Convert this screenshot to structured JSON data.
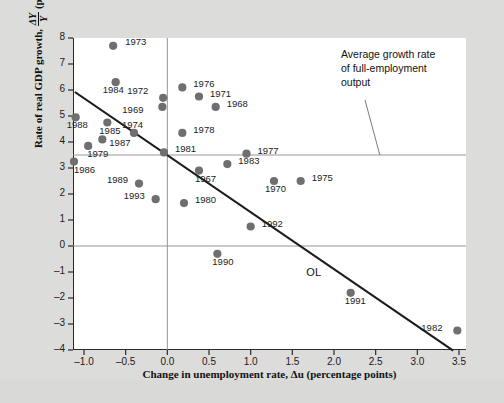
{
  "chart_data": {
    "type": "scatter",
    "title": "",
    "xlabel": "Change in unemployment rate, Δu (percentage points)",
    "ylabel": "Rate of real GDP growth, ΔY/Y (percent per year)",
    "xlim": [
      -1.25,
      3.6
    ],
    "ylim": [
      -4,
      8
    ],
    "xticks": [
      "–1.0",
      "–0.5",
      "0.0",
      "0.5",
      "1.0",
      "1.5",
      "2.0",
      "2.5",
      "3.0",
      "3.5"
    ],
    "xtick_values": [
      -1.0,
      -0.5,
      0.0,
      0.5,
      1.0,
      1.5,
      2.0,
      2.5,
      3.0,
      3.5
    ],
    "yticks": [
      "8",
      "7",
      "6",
      "5",
      "4",
      "3",
      "2",
      "1",
      "0",
      "–1",
      "–2",
      "–3",
      "–4"
    ],
    "ytick_values": [
      8,
      7,
      6,
      5,
      4,
      3,
      2,
      1,
      0,
      -1,
      -2,
      -3,
      -4
    ],
    "grid": false,
    "reference_lines": [
      {
        "name": "full-employment-growth-line",
        "orientation": "horizontal",
        "y": 3.5
      },
      {
        "name": "zero-growth-line",
        "orientation": "horizontal",
        "y": 0
      },
      {
        "name": "zero-unemployment-change-line",
        "orientation": "vertical",
        "x": 0
      }
    ],
    "fit_line": {
      "label": "OL",
      "name": "okuns-law-line",
      "x0": -1.1,
      "y0": 5.9,
      "x1": 3.42,
      "y1": -4.0
    },
    "annotation": {
      "text": "Average growth rate of full-employment output",
      "lines": [
        "Average growth rate",
        "of full-employment",
        "output"
      ],
      "points_to": {
        "x": 2.55,
        "y": 3.5
      }
    },
    "point_color": "#6f6f6f",
    "line_color": "#1b1b1b",
    "points": [
      {
        "label": "1973",
        "x": -0.65,
        "y": 7.7,
        "lx": 12,
        "ly": -5
      },
      {
        "label": "1984",
        "x": -0.62,
        "y": 6.3,
        "lx": -13,
        "ly": 7
      },
      {
        "label": "1972",
        "x": -0.05,
        "y": 5.7,
        "lx": -36,
        "ly": -8
      },
      {
        "label": "1969",
        "x": -0.06,
        "y": 5.35,
        "lx": -40,
        "ly": 2
      },
      {
        "label": "1976",
        "x": 0.18,
        "y": 6.1,
        "lx": 11,
        "ly": -4
      },
      {
        "label": "1971",
        "x": 0.38,
        "y": 5.75,
        "lx": 11,
        "ly": -4
      },
      {
        "label": "1968",
        "x": 0.58,
        "y": 5.35,
        "lx": 11,
        "ly": -4
      },
      {
        "label": "1988",
        "x": -1.1,
        "y": 4.95,
        "lx": -9,
        "ly": 7
      },
      {
        "label": "1985",
        "x": -0.72,
        "y": 4.75,
        "lx": -8,
        "ly": 7
      },
      {
        "label": "1974",
        "x": -0.4,
        "y": 4.35,
        "lx": -12,
        "ly": -9
      },
      {
        "label": "1978",
        "x": 0.18,
        "y": 4.35,
        "lx": 11,
        "ly": -4
      },
      {
        "label": "1987",
        "x": -0.78,
        "y": 4.1,
        "lx": 7,
        "ly": 3
      },
      {
        "label": "1979",
        "x": -0.95,
        "y": 3.85,
        "lx": -1,
        "ly": 7
      },
      {
        "label": "1981",
        "x": -0.04,
        "y": 3.6,
        "lx": 11,
        "ly": -4
      },
      {
        "label": "1977",
        "x": 0.95,
        "y": 3.55,
        "lx": 11,
        "ly": -4
      },
      {
        "label": "1986",
        "x": -1.12,
        "y": 3.25,
        "lx": 0,
        "ly": 7
      },
      {
        "label": "1983",
        "x": 0.72,
        "y": 3.15,
        "lx": 11,
        "ly": -4
      },
      {
        "label": "1967",
        "x": 0.38,
        "y": 2.9,
        "lx": -4,
        "ly": 7
      },
      {
        "label": "1970",
        "x": 1.28,
        "y": 2.5,
        "lx": -9,
        "ly": 7
      },
      {
        "label": "1975",
        "x": 1.6,
        "y": 2.5,
        "lx": 11,
        "ly": -4
      },
      {
        "label": "1989",
        "x": -0.34,
        "y": 2.4,
        "lx": -32,
        "ly": -5
      },
      {
        "label": "1993",
        "x": -0.14,
        "y": 1.8,
        "lx": -32,
        "ly": -4
      },
      {
        "label": "1980",
        "x": 0.2,
        "y": 1.65,
        "lx": 11,
        "ly": -4
      },
      {
        "label": "1992",
        "x": 1.0,
        "y": 0.75,
        "lx": 11,
        "ly": -4
      },
      {
        "label": "1990",
        "x": 0.6,
        "y": -0.3,
        "lx": -5,
        "ly": 7
      },
      {
        "label": "1991",
        "x": 2.2,
        "y": -1.8,
        "lx": -6,
        "ly": 7
      },
      {
        "label": "1982",
        "x": 3.48,
        "y": -3.25,
        "lx": -36,
        "ly": -4
      }
    ]
  }
}
